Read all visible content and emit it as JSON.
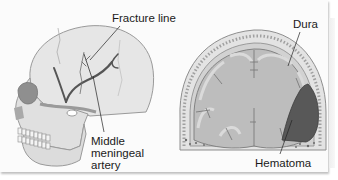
{
  "figure": {
    "left_panel": {
      "subject": "skull-lateral-view",
      "labels": {
        "fracture_line": "Fracture line",
        "artery_line1": "Middle",
        "artery_line2": "meningeal",
        "artery_line3": "artery"
      }
    },
    "right_panel": {
      "subject": "brain-coronal-section",
      "labels": {
        "dura": "Dura",
        "hematoma": "Hematoma"
      }
    },
    "colors": {
      "background": "#fbfbfb",
      "bone": "#e4e4e4",
      "bone_shadow": "#bdbdbd",
      "brain": "#bfbfbf",
      "gray_matter": "#d6d6d6",
      "artery": "#5a5a5a",
      "hematoma": "#585858",
      "label_text": "#1a1a1a"
    }
  }
}
